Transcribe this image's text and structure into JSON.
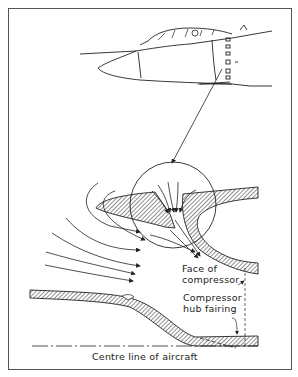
{
  "diagram": {
    "type": "technical-illustration",
    "labels": {
      "face_of_compressor": "Face of compressor",
      "face_line1": "Face of",
      "face_line2": "compressor",
      "hub_line1": "Compressor",
      "hub_line2": "hub fairing",
      "centre_line": "Centre line of aircraft"
    },
    "components": [
      "aircraft-nose-side-view",
      "intake-detail-magnifier-circle",
      "intake-lip",
      "auxiliary-inlet-door",
      "airflow-arrows",
      "compressor-hub-fairing",
      "centre-line"
    ],
    "colors": {
      "ink": "#222222",
      "paper": "#ffffff",
      "frame": "#555555"
    }
  }
}
